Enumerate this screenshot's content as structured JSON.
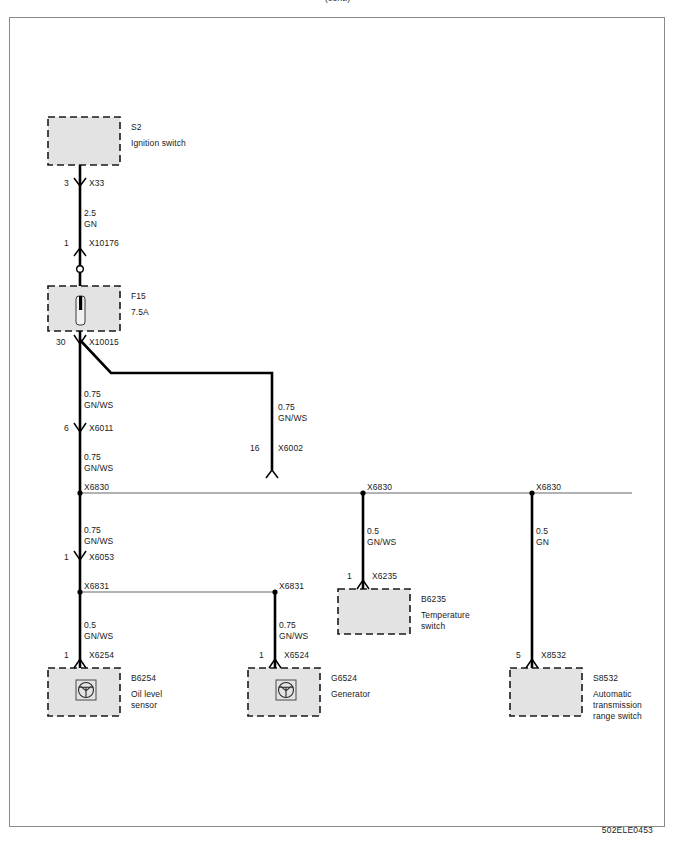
{
  "document": {
    "title": "Wiring diagram — Ignition switch power distribution",
    "footer_code": "502ELE0453",
    "top_clipped_text": "(cont.)"
  },
  "colors": {
    "wire": "#000000",
    "box_fill": "#e3e3e3",
    "box_border": "#1a1a1a",
    "frame_border": "#8a8a8a",
    "thin_line": "#555555",
    "text": "#1a1a1a"
  },
  "components": [
    {
      "id": "S2",
      "name": "Ignition switch",
      "ref": "S2",
      "icon": null,
      "terminal": "3",
      "connector": "X33"
    },
    {
      "id": "F15",
      "name": "",
      "ref": "F15",
      "rating": "7.5A",
      "icon": "fuse-icon",
      "terminal": "30",
      "connector": "X10015"
    },
    {
      "id": "B6254",
      "name_line1": "Oil level",
      "name_line2": "sensor",
      "ref": "B6254",
      "icon": "sensor-icon",
      "terminal": "1",
      "connector": "X6254"
    },
    {
      "id": "G6524",
      "name_line1": "Generator",
      "name_line2": "",
      "ref": "G6524",
      "icon": "generator-icon",
      "terminal": "1",
      "connector": "X6524"
    },
    {
      "id": "B6235",
      "name_line1": "Temperature",
      "name_line2": "switch",
      "ref": "B6235",
      "icon": null,
      "terminal": "1",
      "connector": "X6235"
    },
    {
      "id": "S8532",
      "name_line1": "Automatic",
      "name_line2": "transmission",
      "name_line3": "range switch",
      "ref": "S8532",
      "icon": null,
      "terminal": "5",
      "connector": "X8532"
    }
  ],
  "connectors": {
    "x33": "X33",
    "x10176": "X10176",
    "x10015": "X10015",
    "x6011": "X6011",
    "x6002": "X6002",
    "x6830_left": "X6830",
    "x6830_mid": "X6830",
    "x6830_right": "X6830",
    "x6053": "X6053",
    "x6831_left": "X6831",
    "x6831_mid": "X6831",
    "x6254": "X6254",
    "x6524": "X6524",
    "x6235": "X6235",
    "x8532": "X8532"
  },
  "terminals": {
    "t_x33": "3",
    "t_x10176": "1",
    "t_x10015": "30",
    "t_x6011": "6",
    "t_x6002": "16",
    "t_x6053": "1",
    "t_x6254": "1",
    "t_x6524": "1",
    "t_x6235": "1",
    "t_x8532": "5"
  },
  "wires": [
    {
      "id": "w1",
      "gauge": "2.5",
      "color_code": "GN",
      "from": "X33",
      "to": "X10176"
    },
    {
      "id": "w2",
      "gauge": "0.75",
      "color_code": "GN/WS",
      "from": "X10015",
      "to": "X6011"
    },
    {
      "id": "w3",
      "gauge": "0.75",
      "color_code": "GN/WS",
      "from": "X10015",
      "to": "X6002"
    },
    {
      "id": "w4",
      "gauge": "0.75",
      "color_code": "GN/WS",
      "from": "X6011",
      "to": "X6830"
    },
    {
      "id": "w5",
      "gauge": "0.75",
      "color_code": "GN/WS",
      "from": "X6830",
      "to": "X6053"
    },
    {
      "id": "w6",
      "gauge": "0.5",
      "color_code": "GN/WS",
      "from": "X6831",
      "to": "X6254"
    },
    {
      "id": "w7",
      "gauge": "0.75",
      "color_code": "GN/WS",
      "from": "X6831",
      "to": "X6524"
    },
    {
      "id": "w8",
      "gauge": "0.5",
      "color_code": "GN/WS",
      "from": "X6830",
      "to": "X6235"
    },
    {
      "id": "w9",
      "gauge": "0.5",
      "color_code": "GN",
      "from": "X6830",
      "to": "X8532"
    }
  ],
  "wire_labels": {
    "w1_gauge": "2.5",
    "w1_color": "GN",
    "w2_gauge": "0.75",
    "w2_color": "GN/WS",
    "w3_gauge": "0.75",
    "w3_color": "GN/WS",
    "w4_gauge": "0.75",
    "w4_color": "GN/WS",
    "w5_gauge": "0.75",
    "w5_color": "GN/WS",
    "w6_gauge": "0.5",
    "w6_color": "GN/WS",
    "w7_gauge": "0.75",
    "w7_color": "GN/WS",
    "w8_gauge": "0.5",
    "w8_color": "GN/WS",
    "w9_gauge": "0.5",
    "w9_color": "GN"
  },
  "component_labels": {
    "s2_ref": "S2",
    "s2_name": "Ignition switch",
    "f15_ref": "F15",
    "f15_rating": "7.5A",
    "b6254_ref": "B6254",
    "b6254_name1": "Oil level",
    "b6254_name2": "sensor",
    "g6524_ref": "G6524",
    "g6524_name1": "Generator",
    "b6235_ref": "B6235",
    "b6235_name1": "Temperature",
    "b6235_name2": "switch",
    "s8532_ref": "S8532",
    "s8532_name1": "Automatic",
    "s8532_name2": "transmission",
    "s8532_name3": "range switch"
  }
}
